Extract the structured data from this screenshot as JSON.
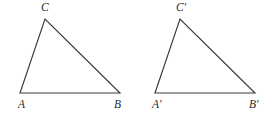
{
  "figure": {
    "type": "geometry-diagram",
    "background_color": "#ffffff",
    "stroke_color": "#3a3a3a",
    "label_color": "#2b2b2b",
    "canvas": {
      "width": 272,
      "height": 117
    },
    "shapes": [
      {
        "name": "triangle-abc",
        "vertices": [
          {
            "label": "A",
            "x": 20,
            "y": 93
          },
          {
            "label": "B",
            "x": 120,
            "y": 93
          },
          {
            "label": "C",
            "x": 45,
            "y": 19
          }
        ],
        "labels": [
          {
            "key": "A",
            "text": "A",
            "x": 18,
            "y": 99
          },
          {
            "key": "B",
            "text": "B",
            "x": 114,
            "y": 99
          },
          {
            "key": "C",
            "text": "C",
            "x": 41,
            "y": 2
          }
        ]
      },
      {
        "name": "triangle-a-prime-b-prime-c-prime",
        "vertices": [
          {
            "label": "A'",
            "x": 155,
            "y": 93
          },
          {
            "label": "B'",
            "x": 255,
            "y": 93
          },
          {
            "label": "C'",
            "x": 180,
            "y": 19
          }
        ],
        "labels": [
          {
            "key": "Aprime",
            "text": "A′",
            "x": 152,
            "y": 99
          },
          {
            "key": "Bprime",
            "text": "B′",
            "x": 249,
            "y": 99
          },
          {
            "key": "Cprime",
            "text": "C′",
            "x": 176,
            "y": 2
          }
        ]
      }
    ]
  },
  "chart_data": {
    "type": "diagram",
    "title": "",
    "shapes": [
      {
        "name": "triangle ABC",
        "points": [
          [
            20,
            93
          ],
          [
            120,
            93
          ],
          [
            45,
            19
          ]
        ],
        "vertex_labels": [
          "A",
          "B",
          "C"
        ],
        "side_lengths_px": {
          "AB": 100,
          "AC": 78.8,
          "BC": 78.1
        }
      },
      {
        "name": "triangle A'B'C'",
        "points": [
          [
            155,
            93
          ],
          [
            255,
            93
          ],
          [
            180,
            19
          ]
        ],
        "vertex_labels": [
          "A′",
          "B′",
          "C′"
        ],
        "side_lengths_px": {
          "A'B'": 100,
          "A'C'": 78.8,
          "B'C'": 78.1
        }
      }
    ]
  }
}
